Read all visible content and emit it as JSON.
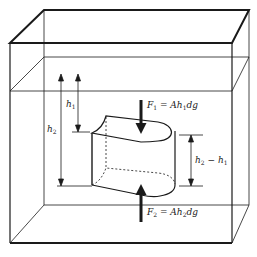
{
  "diagram": {
    "labels": {
      "h1": "h",
      "h1_sub": "1",
      "h2": "h",
      "h2_sub": "2",
      "diff_h2": "h",
      "diff_h2_sub": "2",
      "diff_minus": " − ",
      "diff_h1": "h",
      "diff_h1_sub": "1",
      "f1_F": "F",
      "f1_sub": "1",
      "f1_eq": " = ",
      "f1_A": "Ah",
      "f1_hsub": "1",
      "f1_dg": "dg",
      "f2_F": "F",
      "f2_sub": "2",
      "f2_eq": " = ",
      "f2_A": "Ah",
      "f2_hsub": "2",
      "f2_dg": "dg"
    },
    "colors": {
      "line": "#1a1a1a",
      "background": "#ffffff"
    }
  }
}
